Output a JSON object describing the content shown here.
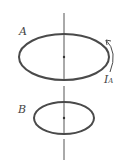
{
  "diagram": {
    "labels": {
      "loop_a": "A",
      "loop_b": "B",
      "current": "I",
      "current_sub": "A"
    },
    "colors": {
      "stroke": "#4a4a4a",
      "axis": "#555555",
      "background": "#ffffff"
    }
  }
}
